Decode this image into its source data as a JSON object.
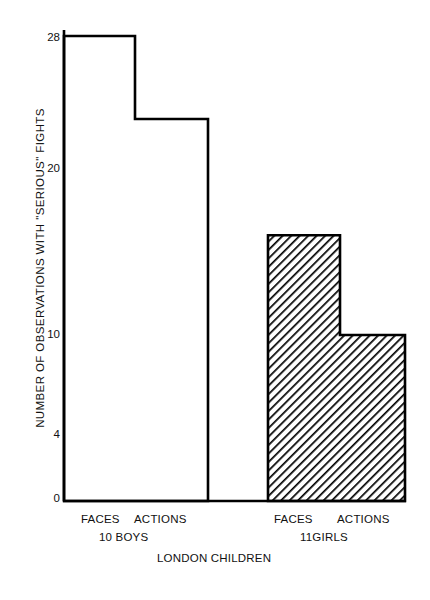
{
  "chart_data": {
    "type": "bar",
    "title": "",
    "subtitle": "",
    "xlabel": "LONDON CHILDREN",
    "ylabel": "NUMBER OF OBSERVATIONS WITH \"SERIOUS\" FIGHTS",
    "categories": [
      "FACES",
      "ACTIONS",
      "FACES",
      "ACTIONS"
    ],
    "values": [
      28,
      23,
      16,
      10
    ],
    "groups": [
      {
        "name": "10 BOYS",
        "categories": [
          "FACES",
          "ACTIONS"
        ],
        "values": [
          28,
          23
        ],
        "fill": "white"
      },
      {
        "name": "11GIRLS",
        "categories": [
          "FACES",
          "ACTIONS"
        ],
        "values": [
          16,
          10
        ],
        "fill": "diagonal-hatch"
      }
    ],
    "ylim": [
      0,
      28
    ],
    "yticks": [
      0,
      4,
      10,
      20,
      28
    ],
    "ytick_labels": [
      "0",
      "4",
      "10",
      "20",
      "28"
    ],
    "xlim": [
      0,
      4
    ],
    "grid": false,
    "legend": false,
    "legend_position": "none",
    "axis_color": "#000000",
    "bar_edge_color": "#000000",
    "hatch_color": "#000000",
    "background": "#ffffff"
  },
  "axes": {
    "y_title": "NUMBER OF OBSERVATIONS WITH \"SERIOUS\" FIGHTS",
    "x_title": "LONDON CHILDREN",
    "y_ticks": [
      {
        "label": "28",
        "value": 28
      },
      {
        "label": "20",
        "value": 20
      },
      {
        "label": "10",
        "value": 10
      },
      {
        "label": "4",
        "value": 4
      },
      {
        "label": "0",
        "value": 0
      }
    ]
  },
  "x_labels": {
    "boys_faces": "FACES",
    "boys_actions": "ACTIONS",
    "boys_group": "10 BOYS",
    "girls_faces": "FACES",
    "girls_actions": "ACTIONS",
    "girls_group": "11GIRLS"
  }
}
